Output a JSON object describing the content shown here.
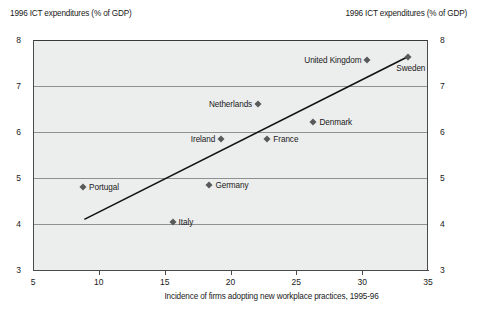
{
  "chart_data": {
    "type": "scatter",
    "title": "",
    "ylabel": "1996 ICT expenditures (% of GDP)",
    "ylabel_right": "1996 ICT expenditures (% of GDP)",
    "xlabel": "Incidence of firms adopting new workplace practices, 1995-96",
    "xlim": [
      5,
      35
    ],
    "ylim": [
      3,
      8
    ],
    "xticks": [
      5,
      10,
      15,
      20,
      25,
      30,
      35
    ],
    "yticks": [
      3,
      4,
      5,
      6,
      7,
      8
    ],
    "grid": true,
    "legend": "none",
    "marker_color": "#59595b",
    "plot_background": "#eceded",
    "points": [
      {
        "label": "Portugal",
        "x": 8.8,
        "y": 4.8,
        "label_side": "right"
      },
      {
        "label": "Italy",
        "x": 15.6,
        "y": 4.04,
        "label_side": "right"
      },
      {
        "label": "Germany",
        "x": 18.4,
        "y": 4.85,
        "label_side": "right"
      },
      {
        "label": "Ireland",
        "x": 19.3,
        "y": 5.85,
        "label_side": "left"
      },
      {
        "label": "Netherlands",
        "x": 22.1,
        "y": 6.61,
        "label_side": "left"
      },
      {
        "label": "France",
        "x": 22.8,
        "y": 5.85,
        "label_side": "right"
      },
      {
        "label": "Denmark",
        "x": 26.3,
        "y": 6.22,
        "label_side": "right"
      },
      {
        "label": "United Kingdom",
        "x": 30.4,
        "y": 7.57,
        "label_side": "left"
      },
      {
        "label": "Sweden",
        "x": 33.5,
        "y": 7.63,
        "label_side": "below"
      }
    ],
    "trendline": {
      "x0": 8.9,
      "y0": 4.1,
      "x1": 33.5,
      "y1": 7.64,
      "color": "#111111"
    }
  }
}
